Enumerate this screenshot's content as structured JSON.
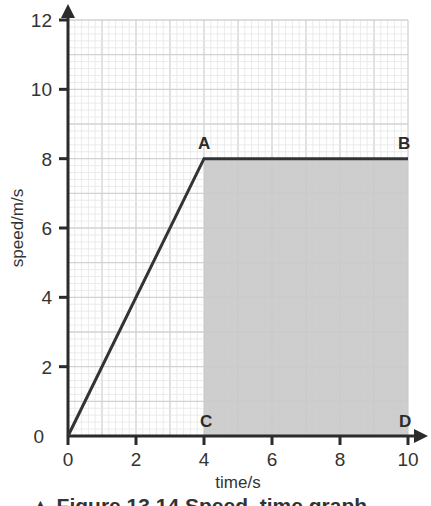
{
  "chart_data": {
    "type": "line",
    "title": "",
    "xlabel": "time/s",
    "ylabel": "speed/m/s",
    "xlim": [
      0,
      10
    ],
    "ylim": [
      0,
      12
    ],
    "grid": true,
    "x_ticks": [
      0,
      2,
      4,
      6,
      8,
      10
    ],
    "y_ticks": [
      0,
      2,
      4,
      6,
      8,
      10,
      12
    ],
    "series": [
      {
        "name": "speed",
        "x": [
          0,
          4,
          10
        ],
        "y": [
          0,
          8,
          8
        ]
      }
    ],
    "shaded_region": {
      "x": [
        4,
        10
      ],
      "y": [
        0,
        8
      ],
      "color": "#cccccc",
      "description": "area under line from A-B down to C-D"
    },
    "annotations": [
      {
        "label": "A",
        "x": 4,
        "y": 8
      },
      {
        "label": "B",
        "x": 10,
        "y": 8
      },
      {
        "label": "C",
        "x": 4,
        "y": 0
      },
      {
        "label": "D",
        "x": 10,
        "y": 0
      }
    ],
    "legend": "none"
  },
  "labels": {
    "xlabel": "time/s",
    "ylabel": "speed/m/s",
    "x_ticks": [
      "0",
      "2",
      "4",
      "6",
      "8",
      "10"
    ],
    "y_ticks": [
      "0",
      "2",
      "4",
      "6",
      "8",
      "10",
      "12"
    ],
    "points": {
      "A": "A",
      "B": "B",
      "C": "C",
      "D": "D"
    },
    "caption": "▲ Figure 13.14 Speed–time graph"
  },
  "colors": {
    "line": "#333333",
    "axis": "#2b2b2b",
    "shade": "#c9c9c9",
    "grid_minor": "#e6e6e6",
    "grid_major": "#d2d2d2"
  }
}
